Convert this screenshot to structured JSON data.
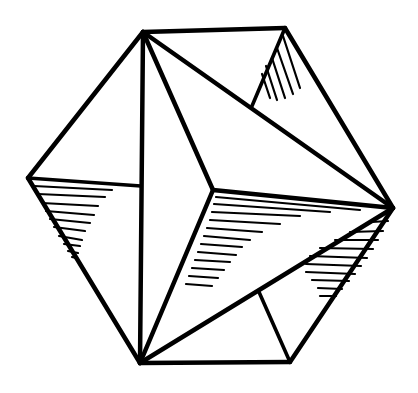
{
  "figure": {
    "width": 418,
    "height": 393,
    "background": "#ffffff",
    "ink": "#000000",
    "stroke_width": 4.5,
    "inner_stroke_width": 3.6,
    "vertices": {
      "A": [
        143,
        32
      ],
      "B": [
        285,
        28
      ],
      "C": [
        393,
        208
      ],
      "D": [
        290,
        362
      ],
      "E": [
        140,
        363
      ],
      "F": [
        28,
        178
      ],
      "G": [
        213,
        190
      ],
      "H": [
        141,
        186
      ],
      "I": [
        252,
        106
      ],
      "J": [
        259,
        292
      ]
    },
    "edges": [
      [
        "A",
        "B"
      ],
      [
        "B",
        "C"
      ],
      [
        "C",
        "D"
      ],
      [
        "D",
        "E"
      ],
      [
        "E",
        "F"
      ],
      [
        "F",
        "A"
      ],
      [
        "A",
        "E"
      ],
      [
        "F",
        "H"
      ],
      [
        "A",
        "G"
      ],
      [
        "G",
        "E"
      ],
      [
        "G",
        "C"
      ],
      [
        "A",
        "C"
      ],
      [
        "E",
        "C"
      ],
      [
        "B",
        "I"
      ],
      [
        "D",
        "J"
      ]
    ],
    "hatching": [
      {
        "face": "B-I-C",
        "lines": [
          [
            283,
            36,
            300,
            88
          ],
          [
            277,
            48,
            293,
            94
          ],
          [
            272,
            58,
            285,
            98
          ],
          [
            266,
            66,
            277,
            100
          ],
          [
            262,
            74,
            270,
            98
          ]
        ]
      },
      {
        "face": "F-H-E",
        "lines": [
          [
            34,
            186,
            112,
            190
          ],
          [
            38,
            194,
            105,
            197
          ],
          [
            42,
            203,
            98,
            206
          ],
          [
            46,
            211,
            94,
            215
          ],
          [
            50,
            219,
            90,
            223
          ],
          [
            54,
            227,
            85,
            231
          ],
          [
            59,
            236,
            82,
            240
          ],
          [
            64,
            244,
            80,
            246
          ],
          [
            68,
            251,
            78,
            253
          ],
          [
            72,
            257,
            76,
            258
          ]
        ]
      },
      {
        "face": "G-C-E",
        "lines": [
          [
            216,
            197,
            360,
            210
          ],
          [
            214,
            204,
            330,
            212
          ],
          [
            212,
            212,
            300,
            216
          ],
          [
            210,
            220,
            280,
            224
          ],
          [
            207,
            228,
            262,
            232
          ],
          [
            204,
            236,
            250,
            240
          ],
          [
            201,
            244,
            242,
            247
          ],
          [
            198,
            252,
            236,
            255
          ],
          [
            195,
            260,
            230,
            262
          ],
          [
            192,
            268,
            224,
            270
          ],
          [
            189,
            276,
            218,
            278
          ],
          [
            186,
            284,
            212,
            286
          ]
        ]
      },
      {
        "face": "C-J-D",
        "lines": [
          [
            372,
            222,
            388,
            221
          ],
          [
            350,
            232,
            383,
            231
          ],
          [
            335,
            240,
            378,
            240
          ],
          [
            320,
            248,
            373,
            249
          ],
          [
            310,
            256,
            367,
            258
          ],
          [
            306,
            264,
            361,
            266
          ],
          [
            306,
            272,
            355,
            274
          ],
          [
            312,
            280,
            349,
            281
          ],
          [
            318,
            288,
            342,
            289
          ],
          [
            320,
            296,
            336,
            296
          ]
        ]
      }
    ]
  }
}
